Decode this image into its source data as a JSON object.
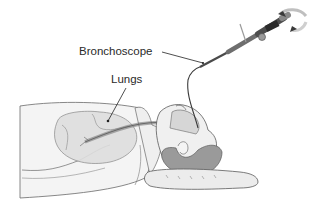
{
  "diagram": {
    "labels": {
      "bronchoscope": "Bronchoscope",
      "lungs": "Lungs"
    },
    "colors": {
      "background": "#ffffff",
      "outline": "#5a5a5a",
      "body_fill": "#f2f2f2",
      "lung_fill": "#dcdcdc",
      "hair_fill": "#9a9a9a",
      "pillow_fill": "#ececec",
      "scope_dark": "#6e6e6e",
      "label_text": "#2a2a2a",
      "leader_line": "#222222"
    }
  }
}
